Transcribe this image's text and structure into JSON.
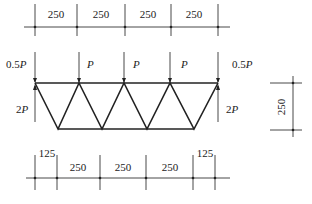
{
  "diagram": {
    "type": "truss-loading",
    "top_dimensions": [
      "250",
      "250",
      "250",
      "250"
    ],
    "bottom_dimensions": [
      "125",
      "250",
      "250",
      "250",
      "125"
    ],
    "height_dimension": "250",
    "loads": [
      {
        "coef": "0.5",
        "sym": "P"
      },
      {
        "coef": "",
        "sym": "P"
      },
      {
        "coef": "",
        "sym": "P"
      },
      {
        "coef": "",
        "sym": "P"
      },
      {
        "coef": "0.5",
        "sym": "P"
      }
    ],
    "reactions": [
      {
        "coef": "2",
        "sym": "P"
      },
      {
        "coef": "2",
        "sym": "P"
      }
    ]
  }
}
